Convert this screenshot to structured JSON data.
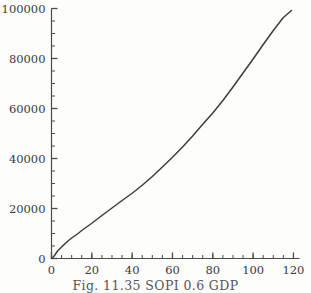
{
  "figure": {
    "caption": "Fig. 11.35 SOPI 0.6 GDP",
    "line_color": "#3d3d3d",
    "axis_color": "#4a4a4a",
    "background_color": "#fdfdfc"
  },
  "chart_data": {
    "type": "line",
    "title": "",
    "subtitle": "",
    "xlabel": "",
    "ylabel": "",
    "xlim": [
      0,
      123
    ],
    "ylim": [
      0,
      100000
    ],
    "grid": false,
    "legend": null,
    "xticks": [
      0,
      20,
      40,
      60,
      80,
      100,
      120
    ],
    "xtick_labels": [
      "0",
      "20",
      "40",
      "60",
      "80",
      "100",
      "120"
    ],
    "xminor_step": 5,
    "yticks": [
      0,
      20000,
      40000,
      60000,
      80000,
      100000
    ],
    "ytick_labels": [
      "0",
      "20000",
      "40000",
      "60000",
      "80000",
      "100000"
    ],
    "yminor_step": 5000,
    "series": [
      {
        "name": "GDP",
        "x": [
          0,
          1,
          2,
          3,
          5,
          8,
          10,
          13,
          15,
          20,
          25,
          30,
          35,
          40,
          45,
          50,
          55,
          60,
          65,
          70,
          75,
          80,
          85,
          90,
          95,
          100,
          105,
          110,
          115,
          119
        ],
        "y": [
          0,
          700,
          1800,
          3000,
          4600,
          6900,
          8200,
          9900,
          11200,
          14100,
          17200,
          20200,
          23200,
          26100,
          29300,
          32800,
          36600,
          40500,
          44600,
          49000,
          53700,
          58200,
          63200,
          68600,
          74200,
          79800,
          85600,
          91200,
          96400,
          99200
        ]
      }
    ]
  }
}
